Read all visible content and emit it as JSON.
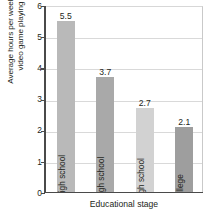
{
  "chart_data": {
    "type": "bar",
    "title": "",
    "categories": [
      "Junior high school",
      "Early high school",
      "Late high school",
      "College"
    ],
    "values": [
      5.5,
      3.7,
      2.7,
      2.1
    ],
    "value_labels": [
      "5.5",
      "3.7",
      "2.7",
      "2.1"
    ],
    "xlabel": "Educational stage",
    "ylabel": "Average hours per week of\nvideo game playing",
    "ylim": [
      0,
      6
    ],
    "yticks": [
      6,
      5,
      4,
      3,
      2,
      1,
      0
    ],
    "ytick_labels": [
      "6",
      "5",
      "4",
      "3",
      "2",
      "1",
      "0"
    ],
    "grid": "horizontal",
    "legend": "none",
    "bar_colors": [
      "#b9b9b9",
      "#a9a9a9",
      "#d2d2d2",
      "#9e9e9e"
    ],
    "axis_color": "#4a4a4a",
    "grid_color": "#d9d9d9",
    "label_orientation": "vertical-inside-bar"
  }
}
